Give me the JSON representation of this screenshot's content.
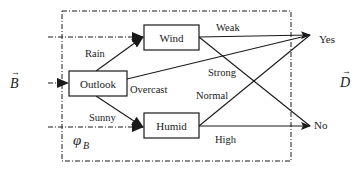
{
  "diagram": {
    "type": "decision-tree",
    "colors": {
      "ink": "#1a1a1a",
      "background": "#ffffff"
    },
    "input_vector": {
      "symbol": "B",
      "arrow": "→"
    },
    "output_vector": {
      "symbol": "D",
      "arrow": "→"
    },
    "mapping_label": {
      "symbol": "φ",
      "subscript": "B"
    },
    "nodes": {
      "outlook": {
        "label": "Outlook"
      },
      "wind": {
        "label": "Wind"
      },
      "humid": {
        "label": "Humid"
      },
      "yes": {
        "label": "Yes"
      },
      "no": {
        "label": "No"
      }
    },
    "edges": {
      "rain": {
        "from": "Outlook",
        "to": "Wind",
        "label": "Rain"
      },
      "overcast": {
        "from": "Outlook",
        "to": "Yes",
        "label": "Overcast"
      },
      "sunny": {
        "from": "Outlook",
        "to": "Humid",
        "label": "Sunny"
      },
      "weak": {
        "from": "Wind",
        "to": "Yes",
        "label": "Weak"
      },
      "strong": {
        "from": "Wind",
        "to": "No",
        "label": "Strong"
      },
      "normal": {
        "from": "Humid",
        "to": "Yes",
        "label": "Normal"
      },
      "high": {
        "from": "Humid",
        "to": "No",
        "label": "High"
      }
    }
  }
}
